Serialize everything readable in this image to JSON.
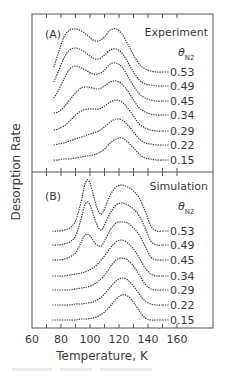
{
  "chart_data": [
    {
      "type": "line",
      "panel": "A",
      "panel_label": "(A)",
      "title": "Experiment",
      "legend_title": "θN2",
      "legend_title_main": "θ",
      "legend_title_sub": "N2",
      "xlabel": "Temperature, K",
      "ylabel": "Desorption Rate",
      "xlim": [
        60,
        180
      ],
      "xticks": [
        60,
        80,
        100,
        120,
        140,
        160
      ],
      "grid": false,
      "curve_style": "dotted, vertically offset stack",
      "series": [
        {
          "name": "0.53",
          "baseline_y": 72,
          "x": [
            75,
            78,
            82,
            86,
            90,
            94,
            98,
            102,
            106,
            110,
            114,
            118,
            122,
            126,
            130,
            134,
            138,
            142,
            146,
            150
          ],
          "values": [
            5,
            18,
            35,
            42,
            43,
            41,
            37,
            32,
            31,
            35,
            42,
            43,
            38,
            28,
            17,
            8,
            3,
            1,
            0,
            0
          ]
        },
        {
          "name": "0.49",
          "baseline_y": 86,
          "x": [
            75,
            78,
            82,
            86,
            90,
            94,
            98,
            102,
            106,
            110,
            114,
            118,
            122,
            126,
            130,
            134,
            138,
            142,
            146,
            150
          ],
          "values": [
            4,
            14,
            28,
            36,
            38,
            36,
            32,
            28,
            27,
            31,
            36,
            37,
            33,
            24,
            14,
            6,
            2,
            1,
            0,
            0
          ]
        },
        {
          "name": "0.45",
          "baseline_y": 101,
          "x": [
            75,
            78,
            82,
            86,
            90,
            94,
            98,
            102,
            106,
            110,
            114,
            118,
            122,
            126,
            130,
            134,
            138,
            142,
            146,
            150
          ],
          "values": [
            3,
            10,
            22,
            32,
            35,
            33,
            30,
            27,
            27,
            31,
            37,
            38,
            34,
            25,
            15,
            7,
            3,
            1,
            0,
            0
          ]
        },
        {
          "name": "0.34",
          "baseline_y": 115,
          "x": [
            75,
            78,
            82,
            86,
            90,
            94,
            98,
            102,
            106,
            110,
            114,
            118,
            122,
            126,
            130,
            134,
            138,
            142,
            146,
            150
          ],
          "values": [
            2,
            3,
            8,
            15,
            22,
            27,
            28,
            27,
            26,
            29,
            33,
            34,
            31,
            24,
            15,
            7,
            3,
            1,
            0,
            0
          ]
        },
        {
          "name": "0.29",
          "baseline_y": 131,
          "x": [
            75,
            78,
            82,
            86,
            90,
            94,
            98,
            102,
            106,
            110,
            114,
            118,
            122,
            126,
            130,
            134,
            138,
            142,
            146,
            150
          ],
          "values": [
            1,
            2,
            5,
            10,
            16,
            20,
            22,
            22,
            22,
            25,
            29,
            31,
            29,
            23,
            15,
            7,
            3,
            1,
            0,
            0
          ]
        },
        {
          "name": "0.22",
          "baseline_y": 145,
          "x": [
            75,
            78,
            82,
            86,
            90,
            94,
            98,
            102,
            106,
            110,
            114,
            118,
            122,
            126,
            130,
            134,
            138,
            142,
            146,
            150
          ],
          "values": [
            0,
            1,
            2,
            4,
            6,
            8,
            10,
            12,
            14,
            18,
            23,
            26,
            25,
            20,
            13,
            6,
            2,
            1,
            0,
            0
          ]
        },
        {
          "name": "0.15",
          "baseline_y": 160,
          "x": [
            75,
            78,
            82,
            86,
            90,
            94,
            98,
            102,
            106,
            110,
            114,
            118,
            122,
            126,
            130,
            134,
            138,
            142,
            146,
            150
          ],
          "values": [
            0,
            0,
            1,
            1,
            2,
            3,
            4,
            5,
            7,
            11,
            17,
            21,
            22,
            18,
            12,
            6,
            2,
            1,
            0,
            0
          ]
        }
      ]
    },
    {
      "type": "line",
      "panel": "B",
      "panel_label": "(B)",
      "title": "Simulation",
      "legend_title": "θN2",
      "legend_title_main": "θ",
      "legend_title_sub": "N2",
      "xlabel": "Temperature, K",
      "ylabel": "Desorption Rate",
      "xlim": [
        60,
        180
      ],
      "xticks": [
        60,
        80,
        100,
        120,
        140,
        160
      ],
      "grid": false,
      "curve_style": "dotted, vertically offset stack",
      "series": [
        {
          "name": "0.53",
          "baseline_y": 231,
          "x": [
            74,
            78,
            82,
            86,
            90,
            94,
            96,
            98,
            100,
            102,
            104,
            106,
            108,
            110,
            114,
            118,
            122,
            126,
            130,
            134,
            138,
            142,
            146,
            150
          ],
          "values": [
            0,
            0,
            1,
            3,
            10,
            30,
            44,
            51,
            48,
            38,
            27,
            19,
            17,
            22,
            36,
            44,
            46,
            44,
            40,
            33,
            20,
            5,
            0,
            0
          ]
        },
        {
          "name": "0.49",
          "baseline_y": 245,
          "x": [
            74,
            78,
            82,
            86,
            90,
            94,
            96,
            98,
            100,
            102,
            104,
            106,
            108,
            110,
            114,
            118,
            122,
            126,
            130,
            134,
            138,
            142,
            146,
            150
          ],
          "values": [
            0,
            0,
            1,
            3,
            9,
            27,
            38,
            43,
            40,
            32,
            23,
            17,
            15,
            20,
            32,
            40,
            42,
            40,
            36,
            29,
            17,
            4,
            0,
            0
          ]
        },
        {
          "name": "0.45",
          "baseline_y": 260,
          "x": [
            74,
            78,
            82,
            86,
            90,
            94,
            96,
            98,
            100,
            102,
            104,
            106,
            108,
            110,
            114,
            118,
            122,
            126,
            130,
            134,
            138,
            142,
            146,
            150
          ],
          "values": [
            0,
            0,
            1,
            3,
            7,
            18,
            24,
            26,
            24,
            20,
            16,
            14,
            14,
            19,
            30,
            37,
            38,
            37,
            32,
            25,
            14,
            3,
            0,
            0
          ]
        },
        {
          "name": "0.34",
          "baseline_y": 276,
          "x": [
            74,
            78,
            82,
            86,
            90,
            94,
            98,
            102,
            106,
            110,
            114,
            118,
            122,
            126,
            130,
            134,
            138,
            142,
            146,
            150
          ],
          "values": [
            0,
            0,
            0,
            1,
            2,
            3,
            5,
            8,
            13,
            20,
            28,
            34,
            36,
            33,
            27,
            18,
            8,
            2,
            0,
            0
          ]
        },
        {
          "name": "0.29",
          "baseline_y": 290,
          "x": [
            74,
            78,
            82,
            86,
            90,
            94,
            98,
            102,
            106,
            110,
            114,
            118,
            122,
            126,
            130,
            134,
            138,
            142,
            146,
            150
          ],
          "values": [
            0,
            0,
            0,
            0,
            1,
            2,
            3,
            5,
            9,
            15,
            23,
            30,
            32,
            30,
            24,
            15,
            6,
            1,
            0,
            0
          ]
        },
        {
          "name": "0.22",
          "baseline_y": 305,
          "x": [
            74,
            78,
            82,
            86,
            90,
            94,
            98,
            102,
            106,
            110,
            114,
            118,
            122,
            126,
            130,
            134,
            138,
            142,
            146,
            150
          ],
          "values": [
            0,
            0,
            0,
            0,
            1,
            1,
            2,
            3,
            6,
            11,
            18,
            24,
            27,
            25,
            19,
            11,
            4,
            1,
            0,
            0
          ]
        },
        {
          "name": "0.15",
          "baseline_y": 320,
          "x": [
            74,
            78,
            82,
            86,
            90,
            94,
            98,
            102,
            106,
            110,
            114,
            118,
            122,
            126,
            130,
            134,
            138,
            142,
            146,
            150
          ],
          "values": [
            0,
            0,
            0,
            0,
            0,
            1,
            1,
            2,
            4,
            8,
            14,
            21,
            25,
            24,
            18,
            9,
            2,
            0,
            0,
            0
          ]
        }
      ]
    }
  ],
  "figure": {
    "ylabel": "Desorption Rate",
    "xlabel": "Temperature, K",
    "xtick_labels": [
      "60",
      "80",
      "100",
      "120",
      "140",
      "160"
    ]
  }
}
